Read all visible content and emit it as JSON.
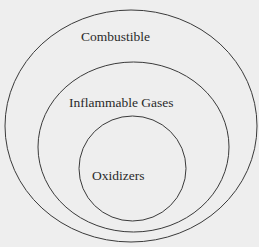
{
  "diagram": {
    "type": "nested-sets",
    "sets": [
      {
        "label": "Combustible",
        "level": "outer"
      },
      {
        "label": "Inflammable Gases",
        "level": "middle"
      },
      {
        "label": "Oxidizers",
        "level": "inner"
      }
    ]
  },
  "colors": {
    "background": "#eeeeee",
    "stroke": "#3a3a3a",
    "text": "#2a2a2a"
  }
}
